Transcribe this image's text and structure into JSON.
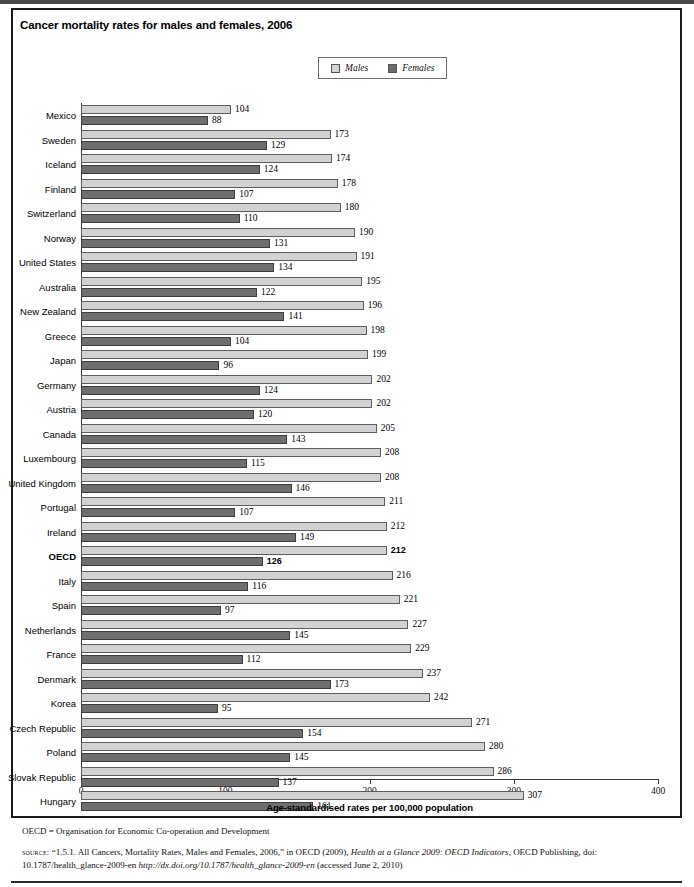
{
  "figure": {
    "title": "Cancer mortality rates for males and females, 2006",
    "note": "OECD = Organisation for Economic Co-operation and Development",
    "source_label": "source:",
    "source_text_1": "“1.5.1. All Cancers, Mortality Rates, Males and Females, 2006,” in OECD (2009), ",
    "source_italic_1": "Health at a Glance 2009: OECD Indicators",
    "source_text_2": ", OECD Publishing, doi: 10.1787/health_glance-2009-en ",
    "source_italic_2": "http://dx.doi.org/10.1787/health_glance-2009-en",
    "source_text_3": " (accessed June 2, 2010)"
  },
  "legend": {
    "position": "top-center",
    "items": [
      {
        "label": "Males",
        "color": "#d2d2d2",
        "icon": "legend-swatch-males"
      },
      {
        "label": "Females",
        "color": "#6b6b6b",
        "icon": "legend-swatch-females"
      }
    ]
  },
  "chart_data": {
    "type": "bar",
    "orientation": "horizontal",
    "grouped": true,
    "title": "Cancer mortality rates for males and females, 2006",
    "xlabel": "Age-standardised rates per 100,000 population",
    "ylabel": "",
    "xlim": [
      0,
      400
    ],
    "xticks": [
      0,
      100,
      200,
      300,
      400
    ],
    "grid": false,
    "legend_position": "top-center",
    "categories": [
      "Mexico",
      "Sweden",
      "Iceland",
      "Finland",
      "Switzerland",
      "Norway",
      "United States",
      "Australia",
      "New Zealand",
      "Greece",
      "Japan",
      "Germany",
      "Austria",
      "Canada",
      "Luxembourg",
      "United Kingdom",
      "Portugal",
      "Ireland",
      "OECD",
      "Italy",
      "Spain",
      "Netherlands",
      "France",
      "Denmark",
      "Korea",
      "Czech Republic",
      "Poland",
      "Slovak Republic",
      "Hungary"
    ],
    "highlight_category": "OECD",
    "series": [
      {
        "name": "Males",
        "color": "#d2d2d2",
        "values": [
          104,
          173,
          174,
          178,
          180,
          190,
          191,
          195,
          196,
          198,
          199,
          202,
          202,
          205,
          208,
          208,
          211,
          212,
          212,
          216,
          221,
          227,
          229,
          237,
          242,
          271,
          280,
          286,
          307
        ]
      },
      {
        "name": "Females",
        "color": "#6e6e6e",
        "values": [
          88,
          129,
          124,
          107,
          110,
          131,
          134,
          122,
          141,
          104,
          96,
          124,
          120,
          143,
          115,
          146,
          107,
          149,
          126,
          116,
          97,
          145,
          112,
          173,
          95,
          154,
          145,
          137,
          161
        ]
      }
    ]
  }
}
